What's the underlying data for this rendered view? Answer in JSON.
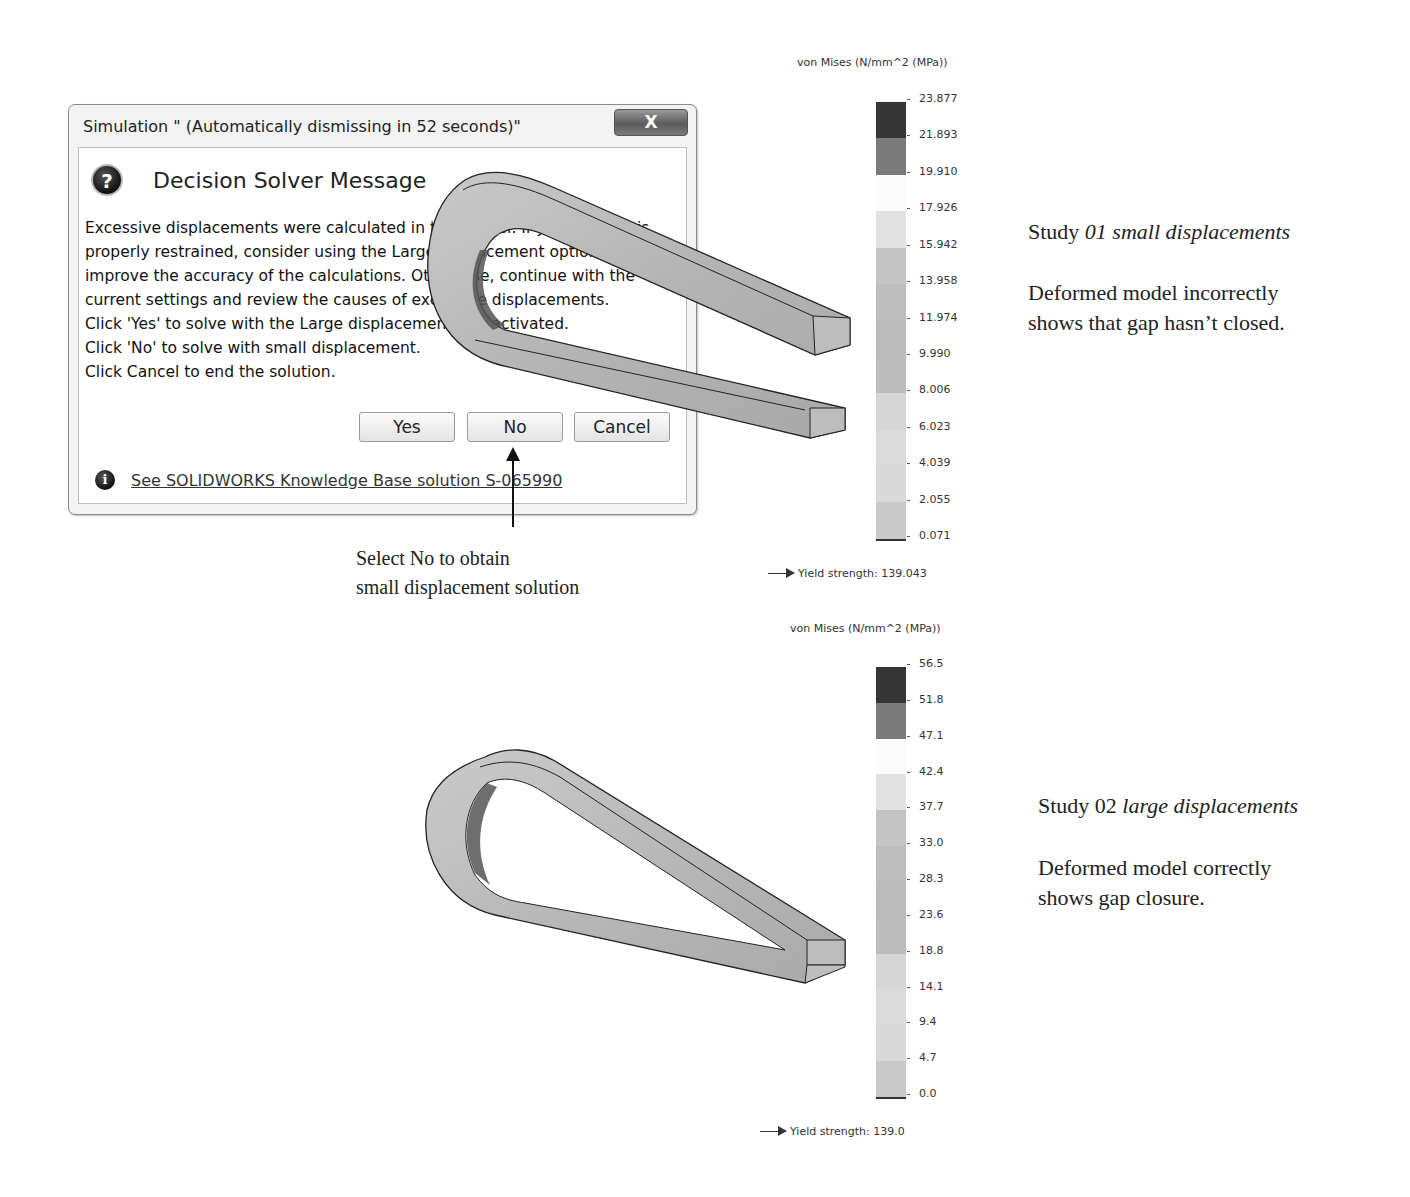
{
  "dialog": {
    "title": "Simulation \" (Automatically dismissing in 52 seconds)\"",
    "close_label": "X",
    "heading": "Decision Solver Message",
    "message_lines": [
      "Excessive displacements were calculated in this model. If your system is",
      "properly restrained, consider using the Large displacement option to",
      "improve the accuracy of the calculations. Otherwise, continue with the",
      "current settings and review the causes of excessive displacements.",
      "Click 'Yes' to solve with the Large displacement flag activated.",
      "Click 'No' to solve with small displacement.",
      "Click Cancel to end the solution."
    ],
    "buttons": {
      "yes": "Yes",
      "no": "No",
      "cancel": "Cancel"
    },
    "kb_link": "See SOLIDWORKS Knowledge Base solution S-065990",
    "icons": {
      "question": "?",
      "info": "i"
    }
  },
  "callout": {
    "line1": "Select No to obtain",
    "line2": "small displacement solution"
  },
  "study1": {
    "title_prefix": "Study ",
    "title_italic": "01 small displacements",
    "desc_line1": "Deformed model incorrectly",
    "desc_line2": "shows that gap hasn’t closed.",
    "legend": {
      "title": "von Mises (N/mm^2 (MPa))",
      "ticks": [
        "23.877",
        "21.893",
        "19.910",
        "17.926",
        "15.942",
        "13.958",
        "11.974",
        "9.990",
        "8.006",
        "6.023",
        "4.039",
        "2.055",
        "0.071"
      ],
      "yield": "Yield strength: 139.043"
    }
  },
  "study2": {
    "title_prefix": "Study 02 ",
    "title_italic": "large displacements",
    "desc_line1": "Deformed model correctly",
    "desc_line2": "shows gap closure.",
    "legend": {
      "title": "von Mises (N/mm^2 (MPa))",
      "ticks": [
        "56.5",
        "51.8",
        "47.1",
        "42.4",
        "37.7",
        "33.0",
        "28.3",
        "23.6",
        "18.8",
        "14.1",
        "9.4",
        "4.7",
        "0.0"
      ],
      "yield": "Yield strength: 139.0"
    }
  },
  "legend_colors": [
    "#353535",
    "#7a7a7a",
    "#fbfbfb",
    "#e2e2e2",
    "#c4c4c4",
    "#bdbdbd",
    "#bbbbbb",
    "#bcbcbc",
    "#d6d6d6",
    "#dadada",
    "#d9d9d9",
    "#c9c9c9"
  ]
}
